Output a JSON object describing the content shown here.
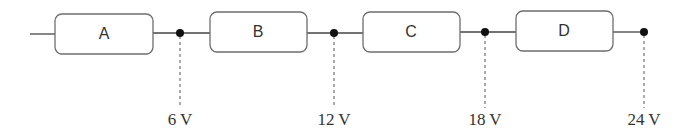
{
  "diagram": {
    "type": "series-circuit-voltage-chain",
    "components": [
      {
        "label": "A"
      },
      {
        "label": "B"
      },
      {
        "label": "C"
      },
      {
        "label": "D"
      }
    ],
    "nodes": [
      {
        "voltage_label": "6 V"
      },
      {
        "voltage_label": "12 V"
      },
      {
        "voltage_label": "18 V"
      },
      {
        "voltage_label": "24 V"
      }
    ],
    "colors": {
      "wire": "#444444",
      "box_border": "#6e6e6e",
      "node": "#111111",
      "text": "#333333"
    }
  }
}
